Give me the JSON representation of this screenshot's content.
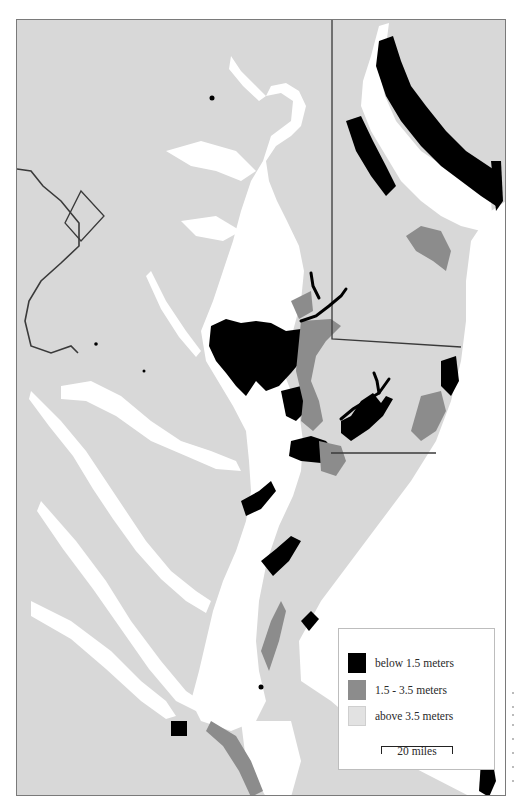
{
  "map": {
    "colors": {
      "land": "#d8d8d8",
      "water": "#ffffff",
      "below_1_5": "#000000",
      "between_1_5_3_5": "#8c8c8c",
      "above_3_5": "#dcdcdc",
      "border": "#3a3a3a",
      "frame": "#7a7a7a"
    }
  },
  "legend": {
    "items": [
      {
        "label": "below 1.5 meters",
        "color": "#000000"
      },
      {
        "label": "1.5 - 3.5 meters",
        "color": "#8c8c8c"
      },
      {
        "label": "above 3.5 meters",
        "color": "#dcdcdc"
      }
    ],
    "scale": {
      "label": "20 miles"
    }
  }
}
